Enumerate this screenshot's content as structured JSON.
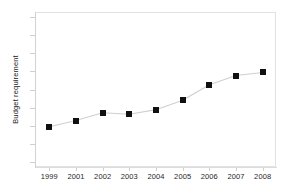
{
  "chart_data": {
    "type": "line",
    "title": "",
    "xlabel": "",
    "ylabel": "Budget requirement",
    "categories": [
      "1999",
      "2001",
      "2002",
      "2003",
      "2004",
      "2005",
      "2006",
      "2007",
      "2008"
    ],
    "values": [
      0.26,
      0.3,
      0.35,
      0.34,
      0.37,
      0.43,
      0.53,
      0.59,
      0.61
    ],
    "ylim": [
      0,
      1
    ],
    "y_tick_labels": [],
    "y_tick_count": 9,
    "grid": false,
    "legend": false,
    "marker": "filled-square",
    "marker_color": "#101010",
    "line_color": "#cfcfcf",
    "frame_color": "#e2e2e2",
    "background": "#ffffff"
  },
  "axes": {
    "y_title": "Budget requirement"
  }
}
